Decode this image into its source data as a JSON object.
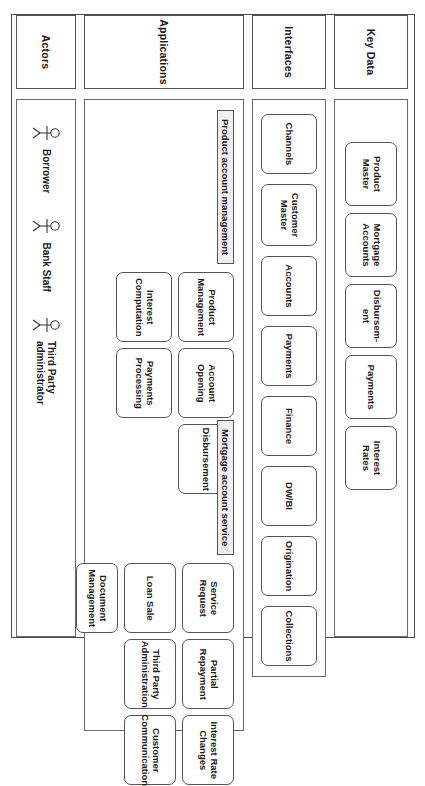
{
  "diagram": {
    "orientation": "rotated-90",
    "colors": {
      "border": "#555555",
      "group_fill": "#efefef",
      "background": "#ffffff"
    }
  },
  "layers": {
    "key_data": {
      "label": "Key Data",
      "items": [
        {
          "label": "Product\nMaster"
        },
        {
          "label": "Mortgage\nAccounts"
        },
        {
          "label": "Disbursem-\nent"
        },
        {
          "label": "Payments"
        },
        {
          "label": "Interest\nRates"
        }
      ]
    },
    "interfaces": {
      "label": "Interfaces",
      "items": [
        {
          "label": "Channels"
        },
        {
          "label": "Customer\nMaster"
        },
        {
          "label": "Accounts"
        },
        {
          "label": "Payments"
        },
        {
          "label": "Finance"
        },
        {
          "label": "DW/BI"
        },
        {
          "label": "Origination"
        },
        {
          "label": "Collections"
        }
      ]
    },
    "applications": {
      "label": "Applications",
      "groups": [
        {
          "title": "Product account management",
          "items": [
            {
              "label": "Product\nManagement"
            },
            {
              "label": "Account\nOpening"
            },
            {
              "label": "Disbursement"
            },
            {
              "label": "Interest\nComputation"
            },
            {
              "label": "Payments\nProcessing"
            }
          ]
        },
        {
          "title": "Mortgage account service",
          "items": [
            {
              "label": "Service\nRequest"
            },
            {
              "label": "Partial\nRepayment"
            },
            {
              "label": "Interest Rate\nChanges"
            },
            {
              "label": "Loan Sale"
            },
            {
              "label": "Third Party\nAdministration"
            },
            {
              "label": "Customer\nCommunication"
            },
            {
              "label": "Document\nManagement"
            }
          ]
        }
      ]
    },
    "actors": {
      "label": "Actors",
      "items": [
        {
          "label": "Borrower",
          "icon": "actor-stick-figure-icon"
        },
        {
          "label": "Bank Staff",
          "icon": "actor-stick-figure-icon"
        },
        {
          "label": "Third Party\nadministrator",
          "icon": "actor-stick-figure-icon"
        }
      ]
    }
  }
}
